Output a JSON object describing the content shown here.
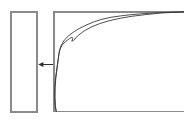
{
  "figure": {
    "caption": "",
    "background_color": "#ffffff",
    "width": 184,
    "height": 122
  },
  "left_panel": {
    "label": "",
    "border_color": "#8a8a8a",
    "fill_color": "#ffffff",
    "x": 10,
    "y": 11,
    "width": 27,
    "height": 101
  },
  "arrow": {
    "label": "",
    "direction": "left",
    "color": "#2e2e2e",
    "x_start": 52,
    "x_end": 38,
    "y": 64
  },
  "right_panel": {
    "label": "",
    "border_color": "#8a8a8a",
    "fill_color": "#ffffff",
    "x": 53,
    "y": 11,
    "width": 131,
    "height": 101,
    "right_edge_open": true
  },
  "chart_data": {
    "type": "line",
    "title": "",
    "subtitle": "",
    "xlabel": "",
    "ylabel": "",
    "xlim": [
      0,
      100
    ],
    "ylim": [
      0,
      100
    ],
    "grid": false,
    "legend_position": "none",
    "tick_labels": {
      "x": [],
      "y": []
    },
    "annotations": [],
    "series": [
      {
        "name": "upper-envelope",
        "color": "#3a3a3a",
        "x": [
          1.8,
          1.2,
          0.9,
          1.0,
          1.6,
          2.6,
          3.4,
          4.0,
          4.6,
          5.6,
          8.0,
          11.5,
          15.5,
          20.0,
          25.5,
          31.0,
          37.0,
          44.0,
          52.0,
          60.0,
          70.0,
          82.0,
          100.0
        ],
        "y": [
          0.0,
          6.0,
          14.0,
          24.0,
          34.0,
          44.0,
          52.0,
          58.0,
          62.0,
          66.0,
          71.5,
          76.0,
          80.0,
          83.5,
          87.0,
          90.0,
          92.5,
          94.5,
          96.0,
          97.2,
          98.2,
          99.2,
          100.0
        ]
      },
      {
        "name": "lower-envelope",
        "color": "#3a3a3a",
        "x": [
          1.8,
          1.0,
          0.7,
          0.8,
          1.4,
          2.4,
          3.2,
          3.8,
          4.3,
          5.0,
          6.4,
          9.0,
          12.0,
          14.0,
          14.6,
          13.8,
          15.0,
          18.5,
          23.0,
          28.5,
          35.0,
          42.5,
          51.0,
          60.0,
          70.5,
          82.5,
          100.0
        ],
        "y": [
          0.0,
          5.5,
          13.5,
          23.5,
          33.5,
          43.5,
          51.0,
          56.5,
          60.0,
          63.0,
          66.5,
          70.0,
          73.0,
          74.5,
          73.0,
          70.5,
          71.0,
          76.0,
          80.5,
          84.5,
          88.0,
          91.0,
          93.5,
          95.5,
          97.2,
          98.8,
          100.0
        ]
      }
    ]
  }
}
